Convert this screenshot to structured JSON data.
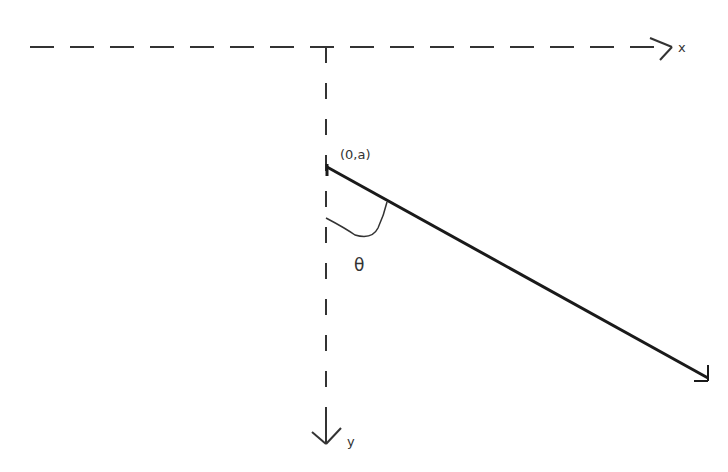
{
  "diagram": {
    "axes": {
      "x_label": "x",
      "y_label": "y",
      "style": "dashed",
      "origin": {
        "px": 326,
        "py": 47
      }
    },
    "point_label": "(0,a)",
    "angle_label": "θ",
    "line": {
      "description": "solid line from (0,a) going down-right at angle θ from vertical y-axis",
      "start": {
        "px": 327,
        "py": 167
      },
      "end": {
        "px": 708,
        "py": 378
      }
    },
    "colors": {
      "stroke": "#1a1a1a",
      "background": "#ffffff"
    }
  }
}
